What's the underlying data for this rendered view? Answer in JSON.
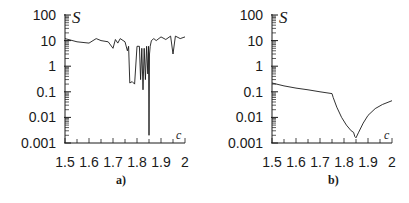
{
  "chart_data": [
    {
      "type": "line",
      "panel_label": "a)",
      "ylabel": "S",
      "xlabel": "c",
      "yscale": "log",
      "ylim": [
        0.001,
        100
      ],
      "xlim": [
        1.5,
        2.0
      ],
      "y_ticks": [
        "100",
        "10",
        "1",
        "0.1",
        "0.01",
        "0.001"
      ],
      "x_ticks": [
        "1.5",
        "1.6",
        "1.7",
        "1.8",
        "1.9",
        "2"
      ],
      "grid": false,
      "legend": null,
      "x": [
        1.5,
        1.55,
        1.6,
        1.63,
        1.65,
        1.68,
        1.7,
        1.71,
        1.72,
        1.73,
        1.75,
        1.76,
        1.765,
        1.77,
        1.78,
        1.79,
        1.8,
        1.81,
        1.815,
        1.82,
        1.825,
        1.83,
        1.835,
        1.84,
        1.845,
        1.848,
        1.85,
        1.852,
        1.855,
        1.86,
        1.87,
        1.88,
        1.9,
        1.92,
        1.94,
        1.95,
        1.96,
        1.98,
        2.0
      ],
      "y": [
        12,
        9,
        8,
        12,
        10,
        9,
        5,
        11,
        8,
        12,
        9,
        4,
        6,
        0.22,
        0.25,
        0.2,
        6,
        6,
        0.3,
        5,
        0.12,
        5,
        0.3,
        6,
        0.5,
        6,
        0.002,
        3,
        6,
        10,
        12,
        10,
        14,
        11,
        15,
        3,
        15,
        12,
        14
      ]
    },
    {
      "type": "line",
      "panel_label": "b)",
      "ylabel": "S",
      "xlabel": "c",
      "yscale": "log",
      "ylim": [
        0.001,
        100
      ],
      "xlim": [
        1.5,
        2.0
      ],
      "y_ticks": [
        "100",
        "10",
        "1",
        "0.1",
        "0.01",
        "0.001"
      ],
      "x_ticks": [
        "1.5",
        "1.6",
        "1.7",
        "1.8",
        "1.9",
        "2"
      ],
      "grid": false,
      "legend": null,
      "x": [
        1.5,
        1.55,
        1.6,
        1.65,
        1.7,
        1.75,
        1.755,
        1.77,
        1.79,
        1.81,
        1.83,
        1.84,
        1.845,
        1.85,
        1.86,
        1.88,
        1.9,
        1.93,
        1.96,
        2.0
      ],
      "y": [
        0.22,
        0.17,
        0.14,
        0.12,
        0.1,
        0.085,
        0.06,
        0.025,
        0.01,
        0.005,
        0.003,
        0.0026,
        0.0018,
        0.0016,
        0.0025,
        0.006,
        0.012,
        0.022,
        0.032,
        0.045
      ]
    }
  ],
  "panels": {
    "a": {
      "label": "a)",
      "ylabel": "S",
      "xlabel": "c",
      "y_ticks": [
        "100",
        "10",
        "1",
        "0.1",
        "0.01",
        "0.001"
      ],
      "x_ticks": [
        "1.5",
        "1.6",
        "1.7",
        "1.8",
        "1.9",
        "2"
      ]
    },
    "b": {
      "label": "b)",
      "ylabel": "S",
      "xlabel": "c",
      "y_ticks": [
        "100",
        "10",
        "1",
        "0.1",
        "0.01",
        "0.001"
      ],
      "x_ticks": [
        "1.5",
        "1.6",
        "1.7",
        "1.8",
        "1.9",
        "2"
      ]
    }
  },
  "colors": {
    "line": "#1a1a1a",
    "axis": "#1a1a1a",
    "background": "#ffffff"
  }
}
